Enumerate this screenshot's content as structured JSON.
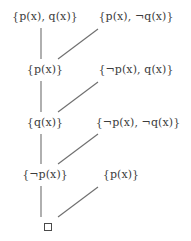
{
  "diagram": {
    "width": 191,
    "height": 241,
    "background_color": "#ffffff",
    "text_color": "#3c3c3c",
    "edge_color": "#6e6e6e",
    "left_column": [
      {
        "id": "L1",
        "label": "{p(x), q(x)}",
        "x": 45,
        "y": 16
      },
      {
        "id": "L2",
        "label": "{p(x)}",
        "x": 45,
        "y": 69
      },
      {
        "id": "L3",
        "label": "{q(x)}",
        "x": 45,
        "y": 122
      },
      {
        "id": "L4",
        "label": "{¬p(x)}",
        "x": 45,
        "y": 174
      }
    ],
    "right_column": [
      {
        "id": "R1",
        "label": "{p(x), ¬q(x)}",
        "x": 136,
        "y": 16
      },
      {
        "id": "R2",
        "label": "{¬p(x), q(x)}",
        "x": 136,
        "y": 69
      },
      {
        "id": "R3",
        "label": "{¬p(x), ¬q(x)}",
        "x": 138,
        "y": 122
      },
      {
        "id": "R4",
        "label": "{p(x)}",
        "x": 121,
        "y": 174
      }
    ],
    "empty_clause": {
      "id": "E",
      "symbol": "□",
      "x": 48,
      "y": 227
    },
    "vertical_edges": [
      {
        "from": "L1",
        "to": "L2",
        "x": 41,
        "y1": 28,
        "y2": 59
      },
      {
        "from": "L2",
        "to": "L3",
        "x": 41,
        "y1": 81,
        "y2": 112
      },
      {
        "from": "L3",
        "to": "L4",
        "x": 41,
        "y1": 134,
        "y2": 164
      },
      {
        "from": "L4",
        "to": "E",
        "x": 41,
        "y1": 186,
        "y2": 217
      }
    ],
    "diagonal_edges": [
      {
        "from": "R1",
        "to": "L2",
        "x1": 58,
        "y1": 59,
        "x2": 98,
        "y2": 29
      },
      {
        "from": "R2",
        "to": "L3",
        "x1": 58,
        "y1": 112,
        "x2": 98,
        "y2": 82
      },
      {
        "from": "R3",
        "to": "L4",
        "x1": 58,
        "y1": 164,
        "x2": 98,
        "y2": 134
      },
      {
        "from": "R4",
        "to": "E",
        "x1": 58,
        "y1": 217,
        "x2": 98,
        "y2": 187
      }
    ]
  }
}
